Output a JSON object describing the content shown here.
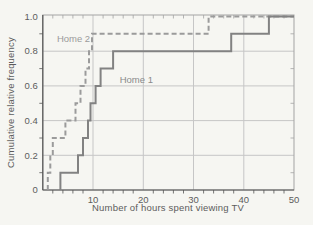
{
  "figure": {
    "background_color": "#f6f6f2",
    "frame_color": "#a3a3a3",
    "axis_color": "#565656",
    "grid_color": "#c6c6c6",
    "text_color": "#5c5c5c"
  },
  "chart_data": {
    "type": "line",
    "subtype": "cumulative-relative-frequency-step",
    "title": "",
    "xlabel": "Number of hours spent viewing TV",
    "ylabel": "Cumulative relative frequency",
    "xlim": [
      0,
      50
    ],
    "ylim": [
      0,
      1.0
    ],
    "x_major_ticks": [
      10,
      20,
      30,
      40,
      50
    ],
    "y_major_ticks": [
      0,
      0.2,
      0.4,
      0.6,
      0.8,
      1.0
    ],
    "y_major_tick_labels": [
      "0",
      "0.2",
      "0.4",
      "0.6",
      "0.8",
      "1.0"
    ],
    "x_minor_tick_step": 2,
    "y_minor_ticks": [
      0.1,
      0.3,
      0.5,
      0.7,
      0.9
    ],
    "grid": true,
    "legend_position": "inline-labels",
    "series": [
      {
        "name": "Home 2",
        "style": "dashed",
        "color": "#9b9b9b",
        "hours_sorted": [
          1,
          1.5,
          2,
          4.5,
          6.5,
          7.5,
          8.5,
          9.2,
          9.8,
          33
        ],
        "cumulative_relative_frequency": [
          0.1,
          0.2,
          0.3,
          0.4,
          0.5,
          0.6,
          0.7,
          0.8,
          0.9,
          1.0
        ]
      },
      {
        "name": "Home 1",
        "style": "solid",
        "color": "#828282",
        "hours_sorted": [
          3.5,
          7,
          8,
          9,
          9.5,
          10.5,
          11.5,
          14,
          37.5,
          45
        ],
        "cumulative_relative_frequency": [
          0.1,
          0.2,
          0.3,
          0.4,
          0.5,
          0.6,
          0.7,
          0.8,
          0.9,
          1.0
        ]
      }
    ],
    "annotations": [
      {
        "text": "Home 2",
        "x": 2.8,
        "y": 0.855,
        "color": "#9b9b9b"
      },
      {
        "text": "Home 1",
        "x": 15.3,
        "y": 0.615,
        "color": "#8a8a8a"
      }
    ]
  }
}
